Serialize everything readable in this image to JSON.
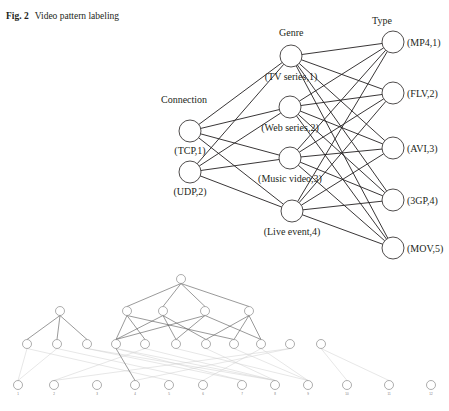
{
  "caption": {
    "fig_label": "Fig. 2",
    "title": "Video pattern labeling"
  },
  "network": {
    "columns": {
      "connection": "Connection",
      "genre": "Genre",
      "type": "Type"
    },
    "connection_nodes": [
      {
        "label": "(TCP,1)",
        "x": 190,
        "y": 131
      },
      {
        "label": "(UDP,2)",
        "x": 190,
        "y": 172
      }
    ],
    "genre_nodes": [
      {
        "label": "(TV series,1)",
        "x": 291,
        "y": 56
      },
      {
        "label": "(Web series,2)",
        "x": 290,
        "y": 107
      },
      {
        "label": "(Music video,3)",
        "x": 290,
        "y": 158
      },
      {
        "label": "(Live event,4)",
        "x": 292,
        "y": 211
      }
    ],
    "type_nodes": [
      {
        "label": "(MP4,1)",
        "x": 393,
        "y": 42
      },
      {
        "label": "(FLV,2)",
        "x": 393,
        "y": 93
      },
      {
        "label": "(AVI,3)",
        "x": 393,
        "y": 148
      },
      {
        "label": "(3GP,4)",
        "x": 393,
        "y": 200
      },
      {
        "label": "(MOV,5)",
        "x": 393,
        "y": 248
      }
    ]
  },
  "tree": {
    "root": {
      "x": 181,
      "y": 279
    },
    "level1": [
      {
        "x": 60,
        "y": 311
      },
      {
        "x": 127,
        "y": 311
      },
      {
        "x": 163,
        "y": 311
      },
      {
        "x": 205,
        "y": 311
      },
      {
        "x": 249,
        "y": 311
      }
    ],
    "level2": [
      {
        "x": 27,
        "y": 344
      },
      {
        "x": 57,
        "y": 344
      },
      {
        "x": 87,
        "y": 344
      },
      {
        "x": 116,
        "y": 344
      },
      {
        "x": 145,
        "y": 344
      },
      {
        "x": 176,
        "y": 344
      },
      {
        "x": 206,
        "y": 344
      },
      {
        "x": 234,
        "y": 344
      },
      {
        "x": 261,
        "y": 344
      },
      {
        "x": 290,
        "y": 344
      },
      {
        "x": 321,
        "y": 344
      }
    ],
    "leaves": [
      {
        "label": "1",
        "x": 18,
        "y": 385
      },
      {
        "label": "2",
        "x": 54,
        "y": 385
      },
      {
        "label": "3",
        "x": 97,
        "y": 385
      },
      {
        "label": "4",
        "x": 135,
        "y": 385
      },
      {
        "label": "5",
        "x": 169,
        "y": 385
      },
      {
        "label": "6",
        "x": 203,
        "y": 385
      },
      {
        "label": "7",
        "x": 242,
        "y": 385
      },
      {
        "label": "8",
        "x": 275,
        "y": 385
      },
      {
        "label": "9",
        "x": 308,
        "y": 385
      },
      {
        "label": "10",
        "x": 347,
        "y": 385
      },
      {
        "label": "11",
        "x": 389,
        "y": 385
      },
      {
        "label": "12",
        "x": 431,
        "y": 385
      }
    ]
  }
}
